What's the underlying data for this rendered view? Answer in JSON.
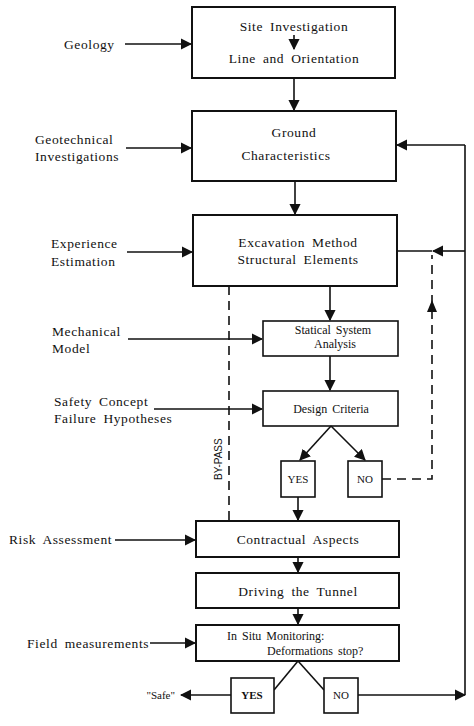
{
  "diagram": {
    "inputs": {
      "geology": "Geology",
      "geotechnical_1": "Geotechnical",
      "geotechnical_2": "Investigations",
      "experience_1": "Experience",
      "experience_2": "Estimation",
      "mechanical_1": "Mechanical",
      "mechanical_2": "Model",
      "safety_1": "Safety  Concept",
      "safety_2": "Failure  Hypotheses",
      "risk": "Risk  Assessment",
      "field": "Field   measurements"
    },
    "boxes": {
      "site_line1": "Site  Investigation",
      "site_line2": "Line  and  Orientation",
      "ground_line1": "Ground",
      "ground_line2": "Characteristics",
      "excavation_line1": "Excavation  Method",
      "excavation_line2": "Structural   Elements",
      "statical_line1": "Statical  System",
      "statical_line2": "Analysis",
      "design": "Design  Criteria",
      "contractual": "Contractual  Aspects",
      "driving": "Driving  the  Tunnel",
      "monitoring_line1": "In  Situ  Monitoring:",
      "monitoring_line2": "Deformations  stop?"
    },
    "decisions": {
      "design_yes": "YES",
      "design_no": "NO",
      "monitor_yes": "YES",
      "monitor_no": "NO"
    },
    "outcome": "\"Safe\"",
    "bypass_label": "BY-PASS"
  }
}
